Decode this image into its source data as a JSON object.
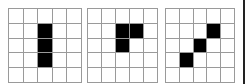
{
  "diagram": {
    "rows": 5,
    "cols": 5,
    "colors": {
      "filled": "#000000",
      "empty": "#ffffff",
      "grid_line": "#9a9a9a"
    },
    "grids": [
      {
        "name": "vertical-bar",
        "left": 8,
        "width": 74,
        "height": 75,
        "filled": [
          [
            1,
            2
          ],
          [
            2,
            2
          ],
          [
            3,
            2
          ]
        ]
      },
      {
        "name": "l-shape",
        "left": 87,
        "width": 71,
        "height": 75,
        "filled": [
          [
            1,
            2
          ],
          [
            1,
            3
          ],
          [
            2,
            2
          ]
        ]
      },
      {
        "name": "diagonal",
        "left": 165,
        "width": 70,
        "height": 75,
        "filled": [
          [
            1,
            3
          ],
          [
            2,
            2
          ],
          [
            3,
            1
          ]
        ]
      }
    ]
  }
}
